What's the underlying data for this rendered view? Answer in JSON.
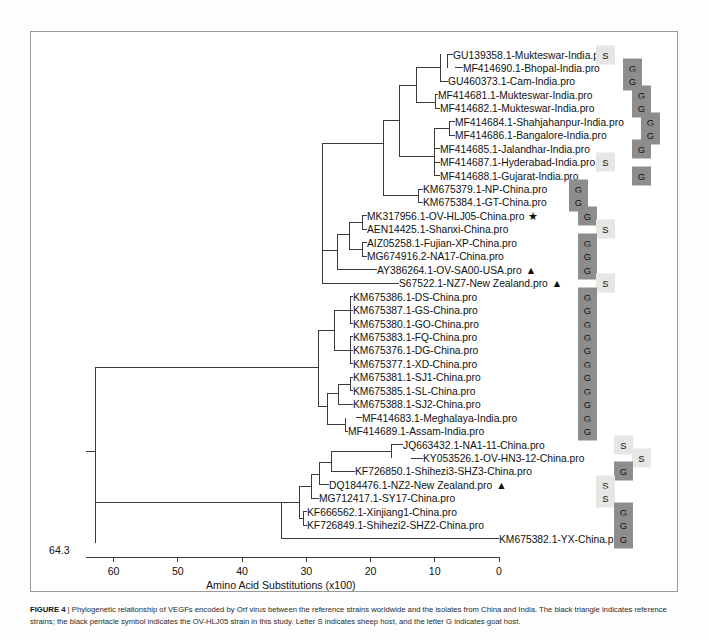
{
  "figure": {
    "label": "FIGURE 4",
    "separator": " | ",
    "caption": "Phylogenetic relationship of VEGFs encoded by Orf virus between the reference strains worldwide and the isolates from China and India. The black triangle indicates reference strains; the black pentacle symbol indicates the OV-HLJ05 strain in this study. Letter S indicates sheep host, and the letter G indicates goat host."
  },
  "axis": {
    "title": "Amino Acid Substitutions (x100)",
    "root_value": "64.3",
    "ticks": [
      "60",
      "50",
      "40",
      "30",
      "20",
      "10",
      "0"
    ],
    "tick_values": [
      60,
      50,
      40,
      30,
      20,
      10,
      0
    ]
  },
  "legend": {
    "sheep_letter": "S",
    "goat_letter": "G",
    "reference_symbol": "▲",
    "study_symbol": "★",
    "goat_color": "#8d8d8d",
    "sheep_color": "#e6e6e6"
  },
  "chart_data": {
    "type": "tree",
    "title": "Phylogenetic relationship of VEGFs encoded by Orf virus",
    "xlabel": "Amino Acid Substitutions (x100)",
    "xlim": [
      64.3,
      0
    ],
    "grid": false,
    "legend_position": "none",
    "taxa": [
      {
        "name": "GU139358.1-Mukteswar-India.pro",
        "host": "S",
        "symbol": ""
      },
      {
        "name": "MF414690.1-Bhopal-India.pro",
        "host": "G",
        "symbol": ""
      },
      {
        "name": "GU460373.1-Cam-India.pro",
        "host": "G",
        "symbol": ""
      },
      {
        "name": "MF414681.1-Mukteswar-India.pro",
        "host": "G",
        "symbol": ""
      },
      {
        "name": "MF414682.1-Mukteswar-India.pro",
        "host": "G",
        "symbol": ""
      },
      {
        "name": "MF414684.1-Shahjahanpur-India.pro",
        "host": "G",
        "symbol": ""
      },
      {
        "name": "MF414686.1-Bangalore-India.pro",
        "host": "G",
        "symbol": ""
      },
      {
        "name": "MF414685.1-Jalandhar-India.pro",
        "host": "G",
        "symbol": ""
      },
      {
        "name": "MF414687.1-Hyderabad-India.pro",
        "host": "S",
        "symbol": ""
      },
      {
        "name": "MF414688.1-Gujarat-India.pro",
        "host": "G",
        "symbol": ""
      },
      {
        "name": "KM675379.1-NP-China.pro",
        "host": "G",
        "symbol": ""
      },
      {
        "name": "KM675384.1-GT-China.pro",
        "host": "G",
        "symbol": ""
      },
      {
        "name": "MK317956.1-OV-HLJ05-China.pro",
        "host": "G",
        "symbol": "★"
      },
      {
        "name": "AEN14425.1-Shanxi-China.pro",
        "host": "S",
        "symbol": ""
      },
      {
        "name": "AIZ05258.1-Fujian-XP-China.pro",
        "host": "G",
        "symbol": ""
      },
      {
        "name": "MG674916.2-NA17-China.pro",
        "host": "G",
        "symbol": ""
      },
      {
        "name": "AY386264.1-OV-SA00-USA.pro",
        "host": "G",
        "symbol": "▲"
      },
      {
        "name": "S67522.1-NZ7-New Zealand.pro",
        "host": "S",
        "symbol": "▲"
      },
      {
        "name": "KM675386.1-DS-China.pro",
        "host": "G",
        "symbol": ""
      },
      {
        "name": "KM675387.1-GS-China.pro",
        "host": "G",
        "symbol": ""
      },
      {
        "name": "KM675380.1-GO-China.pro",
        "host": "G",
        "symbol": ""
      },
      {
        "name": "KM675383.1-FQ-China.pro",
        "host": "G",
        "symbol": ""
      },
      {
        "name": "KM675376.1-DG-China.pro",
        "host": "G",
        "symbol": ""
      },
      {
        "name": "KM675377.1-XD-China.pro",
        "host": "G",
        "symbol": ""
      },
      {
        "name": "KM675381.1-SJ1-China.pro",
        "host": "G",
        "symbol": ""
      },
      {
        "name": "KM675385.1-SL-China.pro",
        "host": "G",
        "symbol": ""
      },
      {
        "name": "KM675388.1-SJ2-China.pro",
        "host": "G",
        "symbol": ""
      },
      {
        "name": "MF414683.1-Meghalaya-India.pro",
        "host": "G",
        "symbol": ""
      },
      {
        "name": "MF414689.1-Assam-India.pro",
        "host": "G",
        "symbol": ""
      },
      {
        "name": "JQ663432.1-NA1-11-China.pro",
        "host": "S",
        "symbol": ""
      },
      {
        "name": "KY053526.1-OV-HN3-12-China.pro",
        "host": "S",
        "symbol": ""
      },
      {
        "name": "KF726850.1-Shihezi3-SHZ3-China.pro",
        "host": "G",
        "symbol": ""
      },
      {
        "name": "DQ184476.1-NZ2-New Zealand.pro",
        "host": "S",
        "symbol": "▲"
      },
      {
        "name": "MG712417.1-SY17-China.pro",
        "host": "S",
        "symbol": ""
      },
      {
        "name": "KF666562.1-Xinjiang1-China.pro",
        "host": "G",
        "symbol": ""
      },
      {
        "name": "KF726849.1-Shihezi2-SHZ2-China.pro",
        "host": "G",
        "symbol": ""
      },
      {
        "name": "KM675382.1-YX-China.pro",
        "host": "G",
        "symbol": ""
      }
    ]
  }
}
